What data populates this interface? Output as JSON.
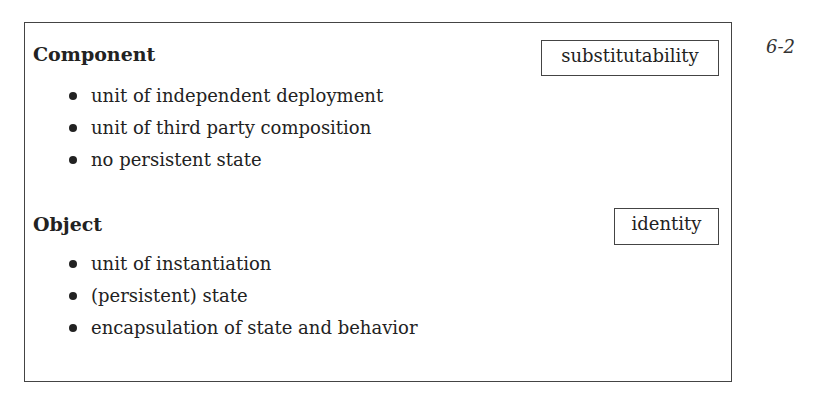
{
  "slide_number": "6-2",
  "sections": [
    {
      "heading": "Component",
      "tag": "substitutability",
      "items": [
        "unit of independent deployment",
        "unit of third party composition",
        "no persistent state"
      ]
    },
    {
      "heading": "Object",
      "tag": "identity",
      "items": [
        "unit of instantiation",
        "(persistent) state",
        "encapsulation of state and behavior"
      ]
    }
  ]
}
